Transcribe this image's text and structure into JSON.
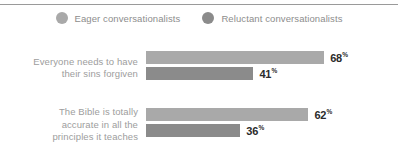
{
  "legend": {
    "items": [
      {
        "label": "Eager conversationalists",
        "color": "#a9a9a9",
        "icon": "circle-marker"
      },
      {
        "label": "Reluctant conversationalists",
        "color": "#8b8b8b",
        "icon": "circle-marker"
      }
    ]
  },
  "percent_symbol": "%",
  "groups": [
    {
      "label": "Everyone needs to have their sins forgiven",
      "label_lines": [
        "Everyone needs to have",
        "their sins forgiven"
      ],
      "bars": [
        {
          "series": "Eager conversationalists",
          "value": 68,
          "value_text": "68"
        },
        {
          "series": "Reluctant conversationalists",
          "value": 41,
          "value_text": "41"
        }
      ]
    },
    {
      "label": "The Bible is totally accurate in all the principles it teaches",
      "label_lines": [
        "The Bible is totally",
        "accurate in all the",
        "principles it teaches"
      ],
      "bars": [
        {
          "series": "Eager conversationalists",
          "value": 62,
          "value_text": "62"
        },
        {
          "series": "Reluctant conversationalists",
          "value": 36,
          "value_text": "36"
        }
      ]
    }
  ],
  "chart_data": {
    "type": "bar",
    "orientation": "horizontal",
    "title": "",
    "subtitle": "",
    "xlabel": "",
    "ylabel": "",
    "xlim": [
      0,
      100
    ],
    "grid": false,
    "legend_position": "top-center",
    "value_suffix": "%",
    "categories": [
      "Everyone needs to have their sins forgiven",
      "The Bible is totally accurate in all the principles it teaches"
    ],
    "series": [
      {
        "name": "Eager conversationalists",
        "color": "#a9a9a9",
        "values": [
          68,
          62
        ]
      },
      {
        "name": "Reluctant conversationalists",
        "color": "#8b8b8b",
        "values": [
          41,
          36
        ]
      }
    ],
    "tick_labels": {
      "x": [],
      "y": [
        "Everyone needs to have their sins forgiven",
        "The Bible is totally accurate in all the principles it teaches"
      ]
    },
    "annotations": [
      "68%",
      "41%",
      "62%",
      "36%"
    ]
  }
}
